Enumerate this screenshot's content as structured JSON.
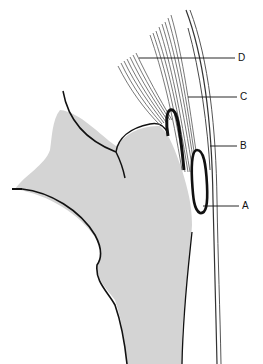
{
  "diagram": {
    "type": "anatomical-line-drawing",
    "colors": {
      "background": "#ffffff",
      "bone_fill": "#d4d4d4",
      "outline": "#111111",
      "fibers": "#444444"
    },
    "labels": [
      {
        "id": "D",
        "text": "D",
        "x": 238,
        "y": 54
      },
      {
        "id": "C",
        "text": "C",
        "x": 240,
        "y": 93
      },
      {
        "id": "B",
        "text": "B",
        "x": 240,
        "y": 142
      },
      {
        "id": "A",
        "text": "A",
        "x": 242,
        "y": 201
      }
    ]
  }
}
